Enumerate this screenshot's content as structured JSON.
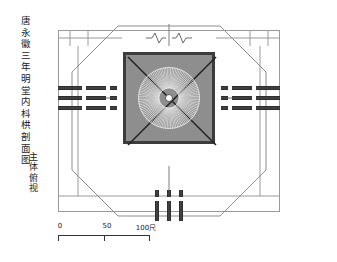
{
  "drawing": {
    "title_main": "唐永徽三年明堂内枓栱剖面图",
    "title_sub": "主体俯视",
    "scale": {
      "labels": [
        "0",
        "50",
        "100尺"
      ],
      "unit": "尺",
      "min": 0,
      "max": 100,
      "midpoint": 50
    },
    "colors": {
      "roof_fill": "#8e8e8e",
      "roof_border": "#3c3c3c",
      "line": "#9a9a9a",
      "hatch_dark": "#3f3f3f",
      "hatch_light": "#b4b4b4",
      "hub_fill": "#fdfdfd",
      "background": "#ffffff"
    },
    "elements": {
      "octagon_label": "octagonal eaves outline",
      "roof_label": "square roof plan with diagonal hips",
      "fan_label": "radiating rafters",
      "hub_label": "central king post",
      "frame_label": "rectangular reference frame",
      "break_label": "break line symbol",
      "bracket_label": "bracket set in plan"
    },
    "geometry": {
      "fan_spokes": 108,
      "fan_outer_radius": 31,
      "fan_inner_radius": 10,
      "hip_diagonals": 4,
      "bracket_groups_per_side": 3
    }
  }
}
